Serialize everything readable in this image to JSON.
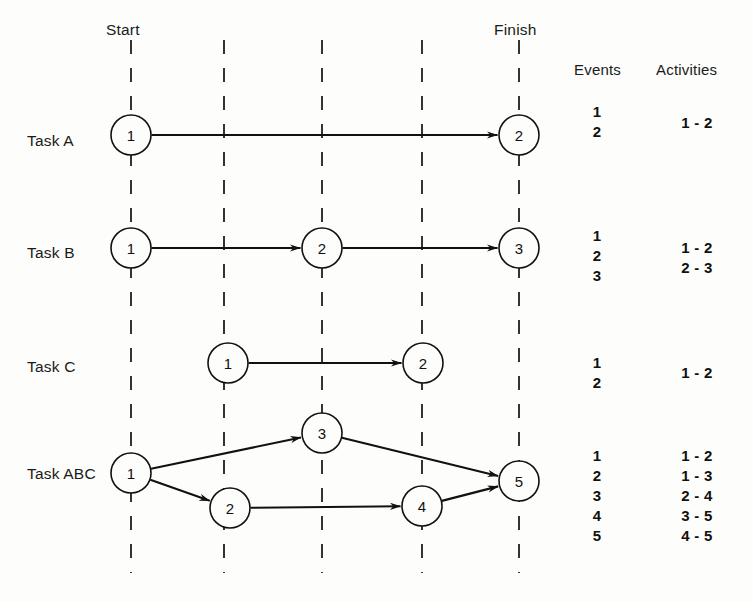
{
  "figure": {
    "type": "network-diagram"
  },
  "milestones": {
    "start_label": "Start",
    "finish_label": "Finish"
  },
  "columns": {
    "events_header": "Events",
    "activities_header": "Activities"
  },
  "timelines": [
    {
      "name": "start-line",
      "x": 131
    },
    {
      "name": "line-2",
      "x": 224
    },
    {
      "name": "line-3",
      "x": 322
    },
    {
      "name": "line-4",
      "x": 422
    },
    {
      "name": "finish-line",
      "x": 519
    }
  ],
  "rows": [
    {
      "task_label": "Task A",
      "label_x": 27,
      "label_y": 140,
      "nodes": [
        {
          "id": "A1",
          "text": "1",
          "cx": 131,
          "cy": 135,
          "r": 20
        },
        {
          "id": "A2",
          "text": "2",
          "cx": 519,
          "cy": 135,
          "r": 20
        }
      ],
      "arrows": [
        {
          "from": "A1",
          "to": "A2"
        }
      ],
      "events": [
        "1",
        "2"
      ],
      "events_x": 597,
      "events_y": 104,
      "activities": [
        "1 - 2"
      ],
      "activities_x": 697,
      "activities_y": 115
    },
    {
      "task_label": "Task B",
      "label_x": 27,
      "label_y": 252,
      "nodes": [
        {
          "id": "B1",
          "text": "1",
          "cx": 131,
          "cy": 248,
          "r": 20
        },
        {
          "id": "B2",
          "text": "2",
          "cx": 322,
          "cy": 248,
          "r": 20
        },
        {
          "id": "B3",
          "text": "3",
          "cx": 519,
          "cy": 248,
          "r": 20
        }
      ],
      "arrows": [
        {
          "from": "B1",
          "to": "B2"
        },
        {
          "from": "B2",
          "to": "B3"
        }
      ],
      "events": [
        "1",
        "2",
        "3"
      ],
      "events_x": 597,
      "events_y": 228,
      "activities": [
        "1 - 2",
        "2 - 3"
      ],
      "activities_x": 697,
      "activities_y": 240
    },
    {
      "task_label": "Task C",
      "label_x": 27,
      "label_y": 366,
      "nodes": [
        {
          "id": "C1",
          "text": "1",
          "cx": 228,
          "cy": 363,
          "r": 20
        },
        {
          "id": "C2",
          "text": "2",
          "cx": 423,
          "cy": 363,
          "r": 20
        }
      ],
      "arrows": [
        {
          "from": "C1",
          "to": "C2"
        }
      ],
      "events": [
        "1",
        "2"
      ],
      "events_x": 597,
      "events_y": 355,
      "activities": [
        "1 - 2"
      ],
      "activities_x": 697,
      "activities_y": 365
    },
    {
      "task_label": "Task ABC",
      "label_x": 27,
      "label_y": 473,
      "nodes": [
        {
          "id": "D1",
          "text": "1",
          "cx": 131,
          "cy": 473,
          "r": 20
        },
        {
          "id": "D3",
          "text": "3",
          "cx": 322,
          "cy": 433,
          "r": 20
        },
        {
          "id": "D2",
          "text": "2",
          "cx": 230,
          "cy": 508,
          "r": 20
        },
        {
          "id": "D4",
          "text": "4",
          "cx": 422,
          "cy": 506,
          "r": 20
        },
        {
          "id": "D5",
          "text": "5",
          "cx": 519,
          "cy": 481,
          "r": 20
        }
      ],
      "arrows": [
        {
          "from": "D1",
          "to": "D3"
        },
        {
          "from": "D1",
          "to": "D2"
        },
        {
          "from": "D3",
          "to": "D5"
        },
        {
          "from": "D2",
          "to": "D4"
        },
        {
          "from": "D4",
          "to": "D5"
        }
      ],
      "events": [
        "1",
        "2",
        "3",
        "4",
        "5"
      ],
      "events_x": 597,
      "events_y": 448,
      "activities": [
        "1 - 2",
        "1 - 3",
        "2 - 4",
        "3 - 5",
        "4 - 5"
      ],
      "activities_x": 697,
      "activities_y": 448
    }
  ],
  "geometry": {
    "line_top": 40,
    "line_bottom": 573,
    "start_label_x": 131,
    "start_label_y": 30,
    "finish_label_x": 519,
    "finish_label_y": 30,
    "events_header_x": 602,
    "events_header_y": 70,
    "activities_header_x": 697,
    "activities_header_y": 70,
    "list_line_height": 20
  },
  "colors": {
    "ink": "#111111",
    "paper": "#fdfdfb"
  }
}
